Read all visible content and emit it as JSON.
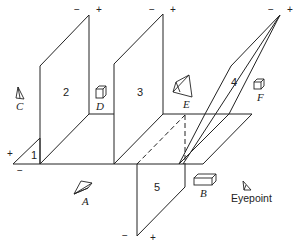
{
  "diagram": {
    "title": "",
    "panels": [
      {
        "id": "1",
        "label": "1",
        "sign_plus": "+",
        "sign_minus": "−"
      },
      {
        "id": "2",
        "label": "2",
        "sign_plus": "+",
        "sign_minus": "−"
      },
      {
        "id": "3",
        "label": "3",
        "sign_plus": "+",
        "sign_minus": "−"
      },
      {
        "id": "4",
        "label": "4",
        "sign_plus": "+",
        "sign_minus": "−"
      },
      {
        "id": "5",
        "label": "5",
        "sign_plus": "+",
        "sign_minus": "−"
      }
    ],
    "objects": [
      {
        "id": "A",
        "label": "A",
        "shape": "pyramid-icon"
      },
      {
        "id": "B",
        "label": "B",
        "shape": "box-icon"
      },
      {
        "id": "C",
        "label": "C",
        "shape": "pyramid-icon"
      },
      {
        "id": "D",
        "label": "D",
        "shape": "cube-icon"
      },
      {
        "id": "E",
        "label": "E",
        "shape": "pyramid-icon"
      },
      {
        "id": "F",
        "label": "F",
        "shape": "cube-icon"
      }
    ],
    "eyepoint": {
      "label": "Eyepoint",
      "shape": "eyepoint-icon"
    },
    "colors": {
      "stroke": "#222222",
      "background": "#ffffff"
    }
  }
}
